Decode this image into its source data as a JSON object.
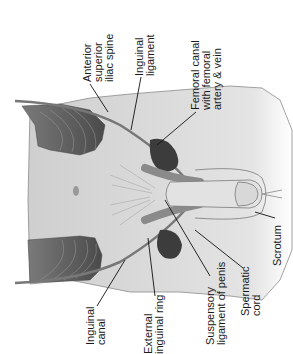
{
  "figure": {
    "labels": {
      "asis": [
        "Anterior",
        "superior",
        "iliac spine"
      ],
      "inguinal_ligament": [
        "Inguinal",
        "ligament"
      ],
      "femoral_canal": [
        "Femoral canal",
        "with femoral",
        "artery & vein"
      ],
      "inguinal_canal": [
        "Inguinal",
        "canal"
      ],
      "external_ring": [
        "External",
        "inguinal ring"
      ],
      "suspensory": [
        "Suspensory",
        "ligament of penis"
      ],
      "spermatic_cord": [
        "Spermatic",
        "cord"
      ],
      "scrotum": [
        "Scrotum"
      ]
    },
    "colors": {
      "skin": "#d6d6d6",
      "skin_light": "#e6e6e6",
      "muscle": "#555555",
      "vessel": "#3a3a3a",
      "outline": "#6e6e6e",
      "leader": "#111111"
    }
  }
}
